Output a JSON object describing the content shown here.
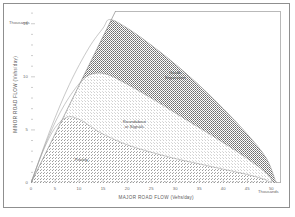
{
  "chart_data": {
    "type": "area",
    "title": "",
    "xlabel": "MAJOR ROAD FLOW",
    "xunit": "(Vehs/day)",
    "ylabel": "MINOR ROAD FLOW",
    "yunit": "(Vehs/day)",
    "x_multiplier_label": "Thousands",
    "y_multiplier_label": "Thousands",
    "xlim": [
      0,
      52
    ],
    "ylim": [
      0,
      16.2
    ],
    "x_ticks": [
      "0",
      "5",
      "10",
      "15",
      "20",
      "25",
      "30",
      "35",
      "40",
      "45",
      "50"
    ],
    "x_tick_values": [
      0,
      5,
      10,
      15,
      20,
      25,
      30,
      35,
      40,
      45,
      50
    ],
    "y_ticks": [
      "0",
      "5",
      "10",
      "15"
    ],
    "y_tick_values": [
      0,
      5,
      10,
      15
    ],
    "grid": false,
    "legend": "none",
    "regions": [
      {
        "name": "priority",
        "label_line1": "Priority",
        "label_line2": "",
        "label_x": 10.5,
        "label_y": 2.2,
        "fill": "#6e6e6e",
        "density": "coarse",
        "boundary_curve": [
          [
            0.0,
            0.0
          ],
          [
            2.5,
            3.0
          ],
          [
            5.0,
            5.2
          ],
          [
            7.5,
            6.2
          ],
          [
            10.0,
            6.0
          ],
          [
            12.5,
            5.3
          ],
          [
            15.0,
            4.6
          ],
          [
            20.0,
            3.6
          ],
          [
            25.0,
            2.9
          ],
          [
            30.0,
            2.3
          ],
          [
            35.0,
            1.8
          ],
          [
            40.0,
            1.3
          ],
          [
            45.0,
            0.8
          ],
          [
            48.5,
            0.35
          ],
          [
            50.0,
            0.0
          ]
        ]
      },
      {
        "name": "roundabout-or-signals",
        "label_line1": "Roundabout",
        "label_line2": "or Signals",
        "label_x": 21.5,
        "label_y": 5.6,
        "fill": "#b9b9b9",
        "density": "light",
        "boundary_curve": [
          [
            0.0,
            0.0
          ],
          [
            3.5,
            4.2
          ],
          [
            7.0,
            7.4
          ],
          [
            10.5,
            9.6
          ],
          [
            13.0,
            10.3
          ],
          [
            16.0,
            10.2
          ],
          [
            20.0,
            9.3
          ],
          [
            25.0,
            8.0
          ],
          [
            30.0,
            6.6
          ],
          [
            35.0,
            5.2
          ],
          [
            40.0,
            3.8
          ],
          [
            45.0,
            2.3
          ],
          [
            49.0,
            0.9
          ],
          [
            50.5,
            0.0
          ]
        ]
      },
      {
        "name": "grade-separation",
        "label_line1": "Grade",
        "label_line2": "Separation",
        "label_x": 30.0,
        "label_y": 10.2,
        "fill": "#595959",
        "density": "dense",
        "boundary_curve": [
          [
            0.0,
            0.0
          ],
          [
            4.0,
            5.0
          ],
          [
            8.0,
            9.3
          ],
          [
            12.0,
            12.7
          ],
          [
            15.0,
            14.6
          ],
          [
            16.4,
            15.4
          ],
          [
            20.0,
            14.6
          ],
          [
            25.0,
            13.0
          ],
          [
            30.0,
            11.2
          ],
          [
            35.0,
            9.2
          ],
          [
            40.0,
            7.0
          ],
          [
            45.0,
            4.6
          ],
          [
            49.0,
            2.3
          ],
          [
            51.0,
            0.0
          ]
        ]
      }
    ],
    "diagonal_line": {
      "name": "equal-flow-boundary",
      "from": [
        0,
        0
      ],
      "to": [
        17.6,
        16.2
      ]
    }
  }
}
